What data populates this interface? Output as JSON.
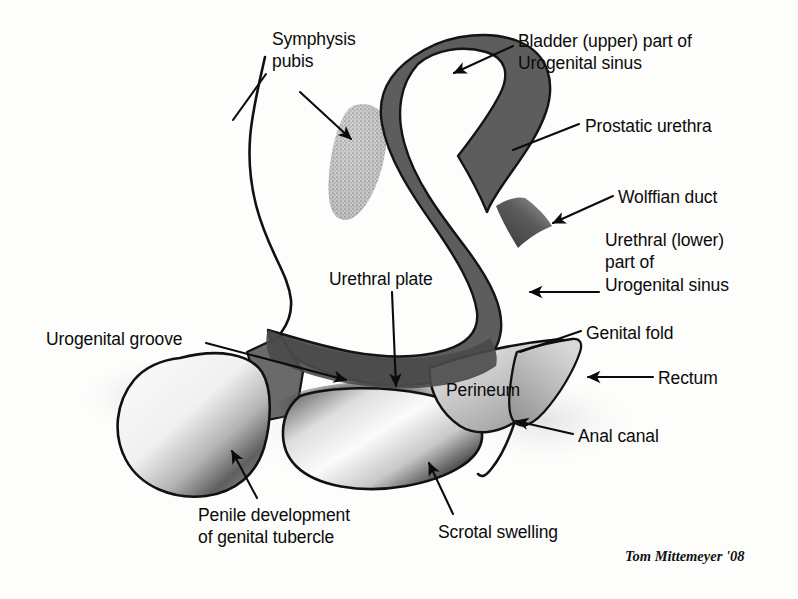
{
  "figure": {
    "background_color": "#fdfdfc",
    "ink_color": "#0b0b0b"
  },
  "signature": {
    "text": "Tom Mittemeyer '08",
    "x": 625,
    "y": 548
  },
  "palette": {
    "outline": "#111111",
    "sinus_dark_gray": "#5d5d5d",
    "sinus_mid_gray": "#6a6a6a",
    "tubercle_light": "#e9e9e9",
    "shadow_gray": "#6f6f6f",
    "stipple_gray": "#b5b5b5",
    "perineum_gray": "#c9c9c9",
    "rectum_gray": "#b0b0b0"
  },
  "labels": [
    {
      "id": "symphysis-pubis",
      "lines": [
        "Symphysis",
        "pubis"
      ],
      "x": 272,
      "y": 28,
      "align": "left"
    },
    {
      "id": "bladder-upper-part",
      "lines": [
        "Bladder (upper) part of",
        "Urogenital sinus"
      ],
      "x": 518,
      "y": 30,
      "align": "left"
    },
    {
      "id": "prostatic-urethra",
      "lines": [
        "Prostatic urethra"
      ],
      "x": 585,
      "y": 115,
      "align": "left"
    },
    {
      "id": "wolffian-duct",
      "lines": [
        "Wolffian duct"
      ],
      "x": 618,
      "y": 186,
      "align": "left"
    },
    {
      "id": "urethral-lower-part",
      "lines": [
        "Urethral (lower)",
        "part of",
        "Urogenital sinus"
      ],
      "x": 605,
      "y": 229,
      "align": "left"
    },
    {
      "id": "urethral-plate",
      "lines": [
        "Urethral plate"
      ],
      "x": 329,
      "y": 268,
      "align": "left"
    },
    {
      "id": "urogenital-groove",
      "lines": [
        "Urogenital groove"
      ],
      "x": 46,
      "y": 328,
      "align": "left"
    },
    {
      "id": "genital-fold",
      "lines": [
        "Genital fold"
      ],
      "x": 586,
      "y": 322,
      "align": "left"
    },
    {
      "id": "perineum",
      "lines": [
        "Perineum"
      ],
      "x": 446,
      "y": 379,
      "align": "left"
    },
    {
      "id": "rectum",
      "lines": [
        "Rectum"
      ],
      "x": 658,
      "y": 367,
      "align": "left"
    },
    {
      "id": "anal-canal",
      "lines": [
        "Anal canal"
      ],
      "x": 578,
      "y": 425,
      "align": "left"
    },
    {
      "id": "penile-development",
      "lines": [
        "Penile development",
        "of genital tubercle"
      ],
      "x": 198,
      "y": 504,
      "align": "left"
    },
    {
      "id": "scrotal-swelling",
      "lines": [
        "Scrotal swelling"
      ],
      "x": 438,
      "y": 521,
      "align": "left"
    }
  ],
  "structures": [
    {
      "id": "urogenital-sinus",
      "name": "Urogenital sinus (bladder and urethral parts)",
      "fill": "#5d5d5d"
    },
    {
      "id": "symphysis-pubis-body",
      "name": "Symphysis pubis",
      "fill": "#b5b5b5",
      "texture": "stippled"
    },
    {
      "id": "genital-tubercle",
      "name": "Penile development of genital tubercle",
      "fill": "#ededed"
    },
    {
      "id": "scrotal-swelling-body",
      "name": "Scrotal swelling",
      "fill": "#efefef"
    },
    {
      "id": "perineum-body",
      "name": "Perineum",
      "fill": "#c9c9c9"
    },
    {
      "id": "rectum-body",
      "name": "Rectum",
      "fill": "#b5b5b5"
    },
    {
      "id": "abdominal-wall",
      "name": "Anterior abdominal wall contour",
      "fill": "none"
    },
    {
      "id": "wolffian-duct-body",
      "name": "Wolffian duct",
      "fill": "#555555"
    },
    {
      "id": "urogenital-groove-body",
      "name": "Urogenital groove",
      "fill": "#5d5d5d"
    }
  ],
  "leaders": [
    {
      "id": "leader-symphysis-pubis",
      "from": [
        300,
        92
      ],
      "to": [
        352,
        140
      ],
      "arrow": true
    },
    {
      "id": "leader-abdominal-wall",
      "from": [
        266,
        75
      ],
      "to": [
        232,
        118
      ],
      "arrow": false
    },
    {
      "id": "leader-bladder",
      "from": [
        512,
        47
      ],
      "to": [
        452,
        74
      ],
      "arrow": true
    },
    {
      "id": "leader-prostatic-urethra",
      "from": [
        578,
        124
      ],
      "to": [
        512,
        150
      ],
      "arrow": false
    },
    {
      "id": "leader-wolffian-duct",
      "from": [
        612,
        196
      ],
      "to": [
        552,
        222
      ],
      "arrow": true
    },
    {
      "id": "leader-urethral-lower",
      "from": [
        598,
        292
      ],
      "to": [
        528,
        292
      ],
      "arrow": true
    },
    {
      "id": "leader-urethral-plate",
      "from": [
        392,
        292
      ],
      "to": [
        396,
        388
      ],
      "arrow": true
    },
    {
      "id": "leader-urogenital-groove",
      "from": [
        208,
        344
      ],
      "to": [
        348,
        381
      ],
      "arrow": true
    },
    {
      "id": "leader-genital-fold",
      "from": [
        580,
        331
      ],
      "to": [
        519,
        352
      ],
      "arrow": false
    },
    {
      "id": "leader-rectum",
      "from": [
        652,
        377
      ],
      "to": [
        586,
        377
      ],
      "arrow": true
    },
    {
      "id": "leader-anal-canal",
      "from": [
        572,
        434
      ],
      "to": [
        514,
        421
      ],
      "arrow": true
    },
    {
      "id": "leader-penile-development",
      "from": [
        256,
        498
      ],
      "to": [
        231,
        449
      ],
      "arrow": true
    },
    {
      "id": "leader-scrotal-swelling",
      "from": [
        452,
        514
      ],
      "to": [
        427,
        461
      ],
      "arrow": true
    }
  ]
}
